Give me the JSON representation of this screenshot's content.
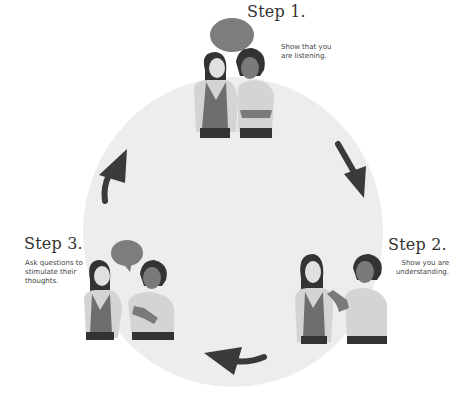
{
  "steps": [
    {
      "title": "Step 1.",
      "desc_lines": [
        "Show that you",
        "are listening."
      ]
    },
    {
      "title": "Step 2.",
      "desc_lines": [
        "Show you are",
        "understanding."
      ]
    },
    {
      "title": "Step 3.",
      "desc_lines": [
        "Ask questions to",
        "stimulate their",
        "thoughts."
      ]
    }
  ],
  "colors": {
    "circle": "#ededed",
    "arrow": "#3a3a3a",
    "skin_light": "#e0e0e0",
    "skin_dark": "#7a7a7a",
    "hair": "#333333",
    "shirt_light": "#d4d4d4",
    "top_dark": "#6e6e6e",
    "bubble": "#7d7d7d"
  }
}
